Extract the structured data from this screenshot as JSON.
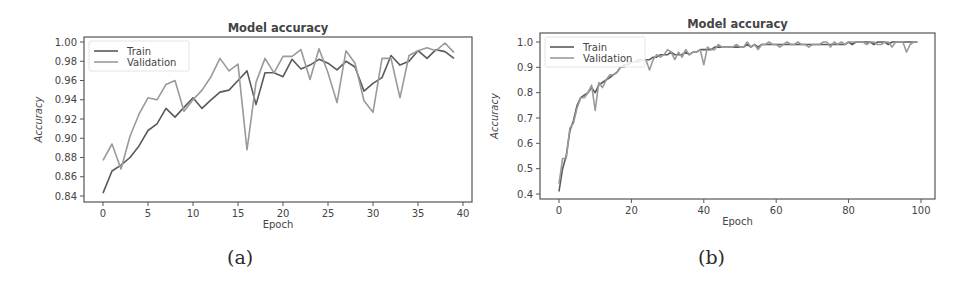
{
  "chart_data": [
    {
      "type": "line",
      "panel": "a",
      "caption": "(a)",
      "title": "Model accuracy",
      "xlabel": "Epoch",
      "ylabel": "Accuracy",
      "xlim": [
        -2,
        41
      ],
      "ylim": [
        0.837,
        1.005
      ],
      "xticks": [
        0,
        5,
        10,
        15,
        20,
        25,
        30,
        35,
        40
      ],
      "yticks": [
        0.84,
        0.86,
        0.88,
        0.9,
        0.92,
        0.94,
        0.96,
        0.98,
        1.0
      ],
      "ytick_labels": [
        "0.84",
        "0.86",
        "0.88",
        "0.90",
        "0.92",
        "0.94",
        "0.96",
        "0.98",
        "1.00"
      ],
      "legend_position": "upper left",
      "grid": false,
      "x": [
        0,
        1,
        2,
        3,
        4,
        5,
        6,
        7,
        8,
        9,
        10,
        11,
        12,
        13,
        14,
        15,
        16,
        17,
        18,
        19,
        20,
        21,
        22,
        23,
        24,
        25,
        26,
        27,
        28,
        29,
        30,
        31,
        32,
        33,
        34,
        35,
        36,
        37,
        38,
        39
      ],
      "series": [
        {
          "name": "Train",
          "color": "#5a5a5a",
          "values": [
            0.843,
            0.866,
            0.872,
            0.88,
            0.892,
            0.908,
            0.915,
            0.931,
            0.922,
            0.932,
            0.942,
            0.931,
            0.94,
            0.948,
            0.95,
            0.96,
            0.97,
            0.935,
            0.968,
            0.968,
            0.964,
            0.982,
            0.972,
            0.976,
            0.982,
            0.978,
            0.971,
            0.98,
            0.974,
            0.949,
            0.957,
            0.963,
            0.986,
            0.976,
            0.98,
            0.991,
            0.983,
            0.992,
            0.99,
            0.983
          ]
        },
        {
          "name": "Validation",
          "color": "#9a9a9a",
          "values": [
            0.877,
            0.894,
            0.868,
            0.902,
            0.925,
            0.942,
            0.94,
            0.956,
            0.96,
            0.928,
            0.94,
            0.95,
            0.964,
            0.983,
            0.97,
            0.977,
            0.888,
            0.958,
            0.983,
            0.968,
            0.985,
            0.985,
            0.992,
            0.961,
            0.993,
            0.968,
            0.937,
            0.991,
            0.978,
            0.939,
            0.927,
            0.983,
            0.983,
            0.942,
            0.986,
            0.991,
            0.994,
            0.991,
            0.999,
            0.989
          ]
        }
      ]
    },
    {
      "type": "line",
      "panel": "b",
      "caption": "(b)",
      "title": "Model accuracy",
      "xlabel": "Epoch",
      "ylabel": "Accuracy",
      "xlim": [
        -5,
        104
      ],
      "ylim": [
        0.38,
        1.03
      ],
      "xticks": [
        0,
        20,
        40,
        60,
        80,
        100
      ],
      "yticks": [
        0.4,
        0.5,
        0.6,
        0.7,
        0.8,
        0.9,
        1.0
      ],
      "ytick_labels": [
        "0.4",
        "0.5",
        "0.6",
        "0.7",
        "0.8",
        "0.9",
        "1.0"
      ],
      "legend_position": "upper left",
      "grid": false,
      "x_count": 100,
      "series": [
        {
          "name": "Train",
          "color": "#5a5a5a",
          "values": [
            0.41,
            0.5,
            0.55,
            0.65,
            0.69,
            0.75,
            0.78,
            0.79,
            0.8,
            0.82,
            0.8,
            0.83,
            0.84,
            0.85,
            0.86,
            0.87,
            0.88,
            0.9,
            0.91,
            0.91,
            0.92,
            0.92,
            0.93,
            0.93,
            0.93,
            0.93,
            0.94,
            0.94,
            0.95,
            0.95,
            0.95,
            0.96,
            0.95,
            0.95,
            0.95,
            0.96,
            0.95,
            0.96,
            0.96,
            0.97,
            0.97,
            0.97,
            0.97,
            0.98,
            0.98,
            0.98,
            0.98,
            0.98,
            0.98,
            0.98,
            0.98,
            0.98,
            0.99,
            0.98,
            0.99,
            0.98,
            0.99,
            0.99,
            0.99,
            0.99,
            0.99,
            0.99,
            0.99,
            0.99,
            0.99,
            0.99,
            0.99,
            0.99,
            0.99,
            0.99,
            0.99,
            0.99,
            0.99,
            0.99,
            0.99,
            0.99,
            0.99,
            0.99,
            0.99,
            0.99,
            1.0,
            0.99,
            1.0,
            1.0,
            1.0,
            1.0,
            1.0,
            0.99,
            1.0,
            1.0,
            1.0,
            0.99,
            1.0,
            1.0,
            1.0,
            1.0,
            1.0,
            1.0,
            1.0,
            1.0
          ]
        },
        {
          "name": "Validation",
          "color": "#9a9a9a",
          "values": [
            0.44,
            0.54,
            0.54,
            0.66,
            0.68,
            0.74,
            0.78,
            0.78,
            0.8,
            0.83,
            0.73,
            0.84,
            0.82,
            0.85,
            0.87,
            0.87,
            0.88,
            0.9,
            0.9,
            0.92,
            0.92,
            0.92,
            0.92,
            0.93,
            0.93,
            0.89,
            0.93,
            0.95,
            0.94,
            0.95,
            0.97,
            0.96,
            0.93,
            0.96,
            0.94,
            0.97,
            0.95,
            0.96,
            0.96,
            0.97,
            0.91,
            0.98,
            0.97,
            0.97,
            0.99,
            0.98,
            0.98,
            0.98,
            0.98,
            0.99,
            0.98,
            0.98,
            1.0,
            0.98,
            0.99,
            0.97,
            0.99,
            0.99,
            1.0,
            0.99,
            0.99,
            0.98,
            0.99,
            1.0,
            0.99,
            0.99,
            1.0,
            0.99,
            0.99,
            0.98,
            0.99,
            0.99,
            0.99,
            1.0,
            1.0,
            0.98,
            1.0,
            0.99,
            1.0,
            0.99,
            1.0,
            1.0,
            1.0,
            1.0,
            1.0,
            0.99,
            1.0,
            1.0,
            0.99,
            0.99,
            1.0,
            1.0,
            0.98,
            1.0,
            1.0,
            1.0,
            0.96,
            0.99,
            1.0,
            1.0
          ]
        }
      ]
    }
  ],
  "layout": {
    "panels": [
      {
        "plot_left": 84,
        "plot_top": 37,
        "plot_right": 472,
        "plot_bottom": 202,
        "x0_px": 103,
        "x_scale": 9.0,
        "y_top_val": 1.0,
        "y_top_px": 42,
        "y_bot_val": 0.84,
        "y_bot_px": 196
      },
      {
        "plot_left": 60,
        "plot_top": 33,
        "plot_right": 455,
        "plot_bottom": 199,
        "x0_px": 79,
        "x_scale": 3.62,
        "y_top_val": 1.0,
        "y_top_px": 42,
        "y_bot_val": 0.4,
        "y_bot_px": 194
      }
    ]
  }
}
